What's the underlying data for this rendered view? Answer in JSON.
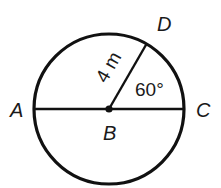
{
  "diagram": {
    "type": "circle-geometry",
    "colors": {
      "stroke": "#111111",
      "background": "#ffffff"
    },
    "points": {
      "A": {
        "label": "A"
      },
      "B": {
        "label": "B",
        "role": "center"
      },
      "C": {
        "label": "C"
      },
      "D": {
        "label": "D"
      }
    },
    "segments": [
      {
        "from": "A",
        "to": "C",
        "type": "diameter"
      },
      {
        "from": "B",
        "to": "D",
        "type": "radius"
      }
    ],
    "radius_label": "4 m",
    "angle_label": "60°",
    "angle": {
      "vertex": "B",
      "between": [
        "C",
        "D"
      ],
      "value": "60°"
    }
  }
}
